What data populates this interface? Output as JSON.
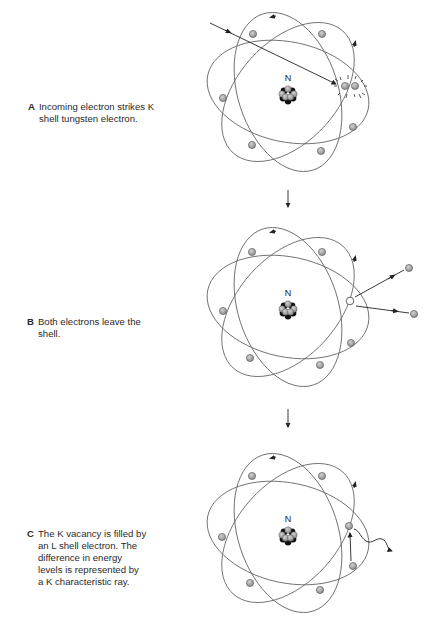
{
  "figure": {
    "panels": [
      {
        "id": "A",
        "letter": "A",
        "lines": [
          "Incoming electron strikes K",
          "shell tungsten electron."
        ],
        "nucleus_label": "N",
        "event": "incoming-electron-collision"
      },
      {
        "id": "B",
        "letter": "B",
        "lines": [
          "Both electrons leave the",
          "shell."
        ],
        "nucleus_label": "N",
        "event": "ejected-electrons"
      },
      {
        "id": "C",
        "letter": "C",
        "lines": [
          "The K vacancy is filled by",
          "an L shell electron. The",
          "difference in energy",
          "levels is represented by",
          "a K characteristic ray."
        ],
        "nucleus_label": "N",
        "event": "characteristic-ray-emission"
      }
    ],
    "colors": {
      "orbit": "#6e6e6e",
      "electron_fill": "#a9a9a9",
      "electron_stroke": "#555555",
      "nucleus_dark": "#111111",
      "nucleus_light": "#9a9a9a",
      "text": "#2a2a2a"
    }
  }
}
